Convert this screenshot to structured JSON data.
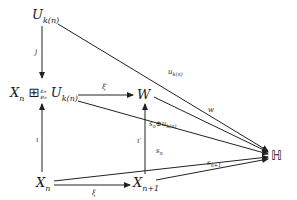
{
  "diagram": {
    "type": "commutative-diagram",
    "nodes": {
      "U_top": {
        "base": "U",
        "sub": "k(n)"
      },
      "X_boxplus_U": {
        "base": "X",
        "sub": "n",
        "op": "⊞",
        "op_sup": "ε_n",
        "op_sub": "e_n",
        "base2": "U",
        "sub2": "k(n)"
      },
      "W": {
        "base": "W"
      },
      "H": {
        "symbol": "ℍ"
      },
      "X_n": {
        "base": "X",
        "sub": "n"
      },
      "X_n1": {
        "base": "X",
        "sub": "n+1"
      }
    },
    "arrows": [
      {
        "from": "U_top",
        "to": "X_boxplus_U",
        "label": "j"
      },
      {
        "from": "X_n",
        "to": "X_boxplus_U",
        "label": "ι"
      },
      {
        "from": "X_boxplus_U",
        "to": "W",
        "label": "ξ'"
      },
      {
        "from": "X_n",
        "to": "X_n1",
        "label": "ξ"
      },
      {
        "from": "X_n1",
        "to": "W",
        "label": "ι'"
      },
      {
        "from": "U_top",
        "to": "H",
        "label": "u_k(n)"
      },
      {
        "from": "W",
        "to": "H",
        "label": "w"
      },
      {
        "from": "X_boxplus_U",
        "to": "H",
        "label": "s_n⊕u_k(n)"
      },
      {
        "from": "X_n",
        "to": "H",
        "label": "s_n"
      },
      {
        "from": "X_n1",
        "to": "H",
        "label": "s_n+1"
      }
    ]
  },
  "labels": {
    "j": "j",
    "iota": "ι",
    "xi_prime": "ξ′",
    "xi": "ξ",
    "iota_prime": "ι′",
    "w": "w",
    "u": "u",
    "u_sub": "k(n)",
    "s": "s",
    "s_n_sub": "n",
    "s_n1_sub": "n+1",
    "oplus": "⊕",
    "H": "ℍ",
    "U": "U",
    "k_n": "k(n)",
    "X": "X",
    "n": "n",
    "n1": "n+1",
    "W": "W",
    "boxplus": "⊞",
    "eps_n": "ε",
    "e_n": "e"
  }
}
